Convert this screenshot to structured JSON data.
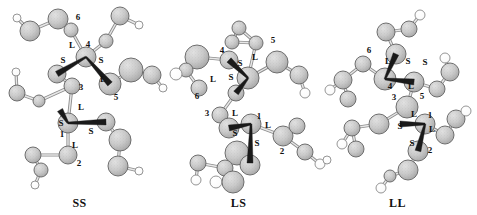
{
  "figure": {
    "background": "#ffffff",
    "panel_count": 3,
    "atom_color": "#c9c9c9",
    "atom_stroke": "#6e6e6e",
    "hydrogen_color": "#ffffff",
    "bond_color": "#9a9a9a",
    "wedge_color": "#1a1a1a",
    "label_color": "#111111"
  },
  "panels": [
    {
      "id": "ss",
      "caption": "SS",
      "center_labels": [
        {
          "text": "6",
          "x": 78,
          "y": 20
        },
        {
          "text": "L",
          "x": 72,
          "y": 48
        },
        {
          "text": "4",
          "x": 88,
          "y": 47
        },
        {
          "text": "S",
          "x": 63,
          "y": 63
        },
        {
          "text": "S",
          "x": 101,
          "y": 63
        },
        {
          "text": "L",
          "x": 103,
          "y": 82
        },
        {
          "text": "5",
          "x": 116,
          "y": 100
        },
        {
          "text": "3",
          "x": 81,
          "y": 90
        },
        {
          "text": "L",
          "x": 81,
          "y": 110
        },
        {
          "text": "S",
          "x": 61,
          "y": 126
        },
        {
          "text": "1",
          "x": 62,
          "y": 137
        },
        {
          "text": "S",
          "x": 91,
          "y": 134
        },
        {
          "text": "L",
          "x": 75,
          "y": 148
        },
        {
          "text": "2",
          "x": 79,
          "y": 166
        }
      ],
      "atoms": [
        {
          "x": 17,
          "y": 18,
          "r": 4,
          "t": "h"
        },
        {
          "x": 30,
          "y": 31,
          "r": 10,
          "t": "c"
        },
        {
          "x": 58,
          "y": 19,
          "r": 10,
          "t": "c"
        },
        {
          "x": 71,
          "y": 30,
          "r": 7,
          "t": "c"
        },
        {
          "x": 86,
          "y": 57,
          "r": 10,
          "t": "c"
        },
        {
          "x": 120,
          "y": 16,
          "r": 9,
          "t": "c"
        },
        {
          "x": 139,
          "y": 25,
          "r": 4,
          "t": "h"
        },
        {
          "x": 106,
          "y": 41,
          "r": 7,
          "t": "c"
        },
        {
          "x": 57,
          "y": 74,
          "r": 9,
          "t": "c"
        },
        {
          "x": 16,
          "y": 72,
          "r": 4,
          "t": "h"
        },
        {
          "x": 17,
          "y": 93,
          "r": 8,
          "t": "c"
        },
        {
          "x": 39,
          "y": 101,
          "r": 6,
          "t": "c"
        },
        {
          "x": 72,
          "y": 86,
          "r": 8,
          "t": "c"
        },
        {
          "x": 110,
          "y": 84,
          "r": 11,
          "t": "c"
        },
        {
          "x": 131,
          "y": 70,
          "r": 12,
          "t": "c"
        },
        {
          "x": 152,
          "y": 75,
          "r": 9,
          "t": "c"
        },
        {
          "x": 163,
          "y": 88,
          "r": 4,
          "t": "h"
        },
        {
          "x": 68,
          "y": 123,
          "r": 10,
          "t": "c"
        },
        {
          "x": 106,
          "y": 122,
          "r": 9,
          "t": "c"
        },
        {
          "x": 120,
          "y": 140,
          "r": 11,
          "t": "c"
        },
        {
          "x": 118,
          "y": 166,
          "r": 10,
          "t": "c"
        },
        {
          "x": 139,
          "y": 171,
          "r": 4,
          "t": "h"
        },
        {
          "x": 68,
          "y": 155,
          "r": 9,
          "t": "c"
        },
        {
          "x": 33,
          "y": 155,
          "r": 8,
          "t": "c"
        },
        {
          "x": 41,
          "y": 170,
          "r": 7,
          "t": "c"
        },
        {
          "x": 35,
          "y": 185,
          "r": 4,
          "t": "h"
        }
      ],
      "bonds": [
        {
          "a": 0,
          "b": 1
        },
        {
          "a": 1,
          "b": 2
        },
        {
          "a": 2,
          "b": 3
        },
        {
          "a": 3,
          "b": 4
        },
        {
          "a": 5,
          "b": 6
        },
        {
          "a": 5,
          "b": 7
        },
        {
          "a": 7,
          "b": 4
        },
        {
          "a": 4,
          "b": 13
        },
        {
          "a": 8,
          "b": 12
        },
        {
          "a": 9,
          "b": 10
        },
        {
          "a": 10,
          "b": 11
        },
        {
          "a": 11,
          "b": 12
        },
        {
          "a": 13,
          "b": 14
        },
        {
          "a": 14,
          "b": 15
        },
        {
          "a": 15,
          "b": 16
        },
        {
          "a": 12,
          "b": 17
        },
        {
          "a": 17,
          "b": 22
        },
        {
          "a": 18,
          "b": 19
        },
        {
          "a": 19,
          "b": 20
        },
        {
          "a": 20,
          "b": 21
        },
        {
          "a": 22,
          "b": 23
        },
        {
          "a": 23,
          "b": 24
        },
        {
          "a": 24,
          "b": 25
        }
      ],
      "wedges": [
        {
          "from": {
            "x": 86,
            "y": 57
          },
          "to": {
            "x": 57,
            "y": 74
          }
        },
        {
          "from": {
            "x": 86,
            "y": 57
          },
          "to": {
            "x": 110,
            "y": 84
          }
        },
        {
          "from": {
            "x": 68,
            "y": 123
          },
          "to": {
            "x": 60,
            "y": 110
          }
        },
        {
          "from": {
            "x": 68,
            "y": 123
          },
          "to": {
            "x": 106,
            "y": 122
          }
        }
      ]
    },
    {
      "id": "ls",
      "caption": "LS",
      "center_labels": [
        {
          "text": "5",
          "x": 273,
          "y": 43
        },
        {
          "text": "4",
          "x": 222,
          "y": 53
        },
        {
          "text": "L",
          "x": 255,
          "y": 60
        },
        {
          "text": "S",
          "x": 240,
          "y": 66
        },
        {
          "text": "S",
          "x": 231,
          "y": 80
        },
        {
          "text": "L",
          "x": 213,
          "y": 82
        },
        {
          "text": "6",
          "x": 197,
          "y": 99
        },
        {
          "text": "3",
          "x": 207,
          "y": 116
        },
        {
          "text": "L",
          "x": 235,
          "y": 116
        },
        {
          "text": "1",
          "x": 259,
          "y": 119
        },
        {
          "text": "L",
          "x": 268,
          "y": 128
        },
        {
          "text": "S",
          "x": 235,
          "y": 136
        },
        {
          "text": "S",
          "x": 257,
          "y": 146
        },
        {
          "text": "2",
          "x": 282,
          "y": 154
        }
      ],
      "atoms": [
        {
          "x": 239,
          "y": 28,
          "r": 7,
          "t": "c"
        },
        {
          "x": 232,
          "y": 42,
          "r": 7,
          "t": "c"
        },
        {
          "x": 256,
          "y": 43,
          "r": 7,
          "t": "c"
        },
        {
          "x": 229,
          "y": 60,
          "r": 9,
          "t": "c"
        },
        {
          "x": 197,
          "y": 57,
          "r": 12,
          "t": "c"
        },
        {
          "x": 186,
          "y": 70,
          "r": 7,
          "t": "c"
        },
        {
          "x": 176,
          "y": 74,
          "r": 6,
          "t": "h"
        },
        {
          "x": 199,
          "y": 88,
          "r": 8,
          "t": "c"
        },
        {
          "x": 248,
          "y": 78,
          "r": 11,
          "t": "c"
        },
        {
          "x": 277,
          "y": 62,
          "r": 11,
          "t": "c"
        },
        {
          "x": 299,
          "y": 75,
          "r": 9,
          "t": "c"
        },
        {
          "x": 305,
          "y": 93,
          "r": 5,
          "t": "h"
        },
        {
          "x": 236,
          "y": 93,
          "r": 8,
          "t": "c"
        },
        {
          "x": 220,
          "y": 115,
          "r": 8,
          "t": "c"
        },
        {
          "x": 229,
          "y": 128,
          "r": 10,
          "t": "c"
        },
        {
          "x": 251,
          "y": 124,
          "r": 10,
          "t": "c"
        },
        {
          "x": 283,
          "y": 136,
          "r": 10,
          "t": "c"
        },
        {
          "x": 297,
          "y": 126,
          "r": 8,
          "t": "c"
        },
        {
          "x": 305,
          "y": 152,
          "r": 8,
          "t": "c"
        },
        {
          "x": 320,
          "y": 164,
          "r": 5,
          "t": "h"
        },
        {
          "x": 237,
          "y": 153,
          "r": 12,
          "t": "c"
        },
        {
          "x": 250,
          "y": 165,
          "r": 10,
          "t": "c"
        },
        {
          "x": 225,
          "y": 168,
          "r": 8,
          "t": "c"
        },
        {
          "x": 198,
          "y": 163,
          "r": 8,
          "t": "c"
        },
        {
          "x": 196,
          "y": 180,
          "r": 5,
          "t": "h"
        },
        {
          "x": 216,
          "y": 182,
          "r": 6,
          "t": "h"
        },
        {
          "x": 233,
          "y": 182,
          "r": 11,
          "t": "c"
        }
      ],
      "bonds": [
        {
          "a": 0,
          "b": 1
        },
        {
          "a": 1,
          "b": 2
        },
        {
          "a": 0,
          "b": 2
        },
        {
          "a": 2,
          "b": 8
        },
        {
          "a": 3,
          "b": 4
        },
        {
          "a": 4,
          "b": 5
        },
        {
          "a": 5,
          "b": 6
        },
        {
          "a": 5,
          "b": 7
        },
        {
          "a": 3,
          "b": 8
        },
        {
          "a": 8,
          "b": 9
        },
        {
          "a": 9,
          "b": 10
        },
        {
          "a": 10,
          "b": 11
        },
        {
          "a": 12,
          "b": 13
        },
        {
          "a": 13,
          "b": 14
        },
        {
          "a": 15,
          "b": 16
        },
        {
          "a": 16,
          "b": 17
        },
        {
          "a": 16,
          "b": 18
        },
        {
          "a": 18,
          "b": 19
        },
        {
          "a": 20,
          "b": 21
        },
        {
          "a": 20,
          "b": 22
        },
        {
          "a": 22,
          "b": 23
        },
        {
          "a": 23,
          "b": 24
        },
        {
          "a": 22,
          "b": 26
        },
        {
          "a": 25,
          "b": 26
        }
      ],
      "wedges": [
        {
          "from": {
            "x": 248,
            "y": 78
          },
          "to": {
            "x": 229,
            "y": 60
          }
        },
        {
          "from": {
            "x": 248,
            "y": 78
          },
          "to": {
            "x": 236,
            "y": 93
          }
        },
        {
          "from": {
            "x": 251,
            "y": 124
          },
          "to": {
            "x": 229,
            "y": 128
          }
        },
        {
          "from": {
            "x": 251,
            "y": 124
          },
          "to": {
            "x": 250,
            "y": 163
          }
        }
      ]
    },
    {
      "id": "ll",
      "caption": "LL",
      "center_labels": [
        {
          "text": "6",
          "x": 369,
          "y": 53
        },
        {
          "text": "L",
          "x": 388,
          "y": 64
        },
        {
          "text": "S",
          "x": 408,
          "y": 64
        },
        {
          "text": "S",
          "x": 425,
          "y": 65
        },
        {
          "text": "4",
          "x": 390,
          "y": 89
        },
        {
          "text": "L",
          "x": 411,
          "y": 89
        },
        {
          "text": "3",
          "x": 394,
          "y": 100
        },
        {
          "text": "5",
          "x": 422,
          "y": 99
        },
        {
          "text": "L",
          "x": 414,
          "y": 117
        },
        {
          "text": "1",
          "x": 430,
          "y": 118
        },
        {
          "text": "S",
          "x": 400,
          "y": 129
        },
        {
          "text": "L",
          "x": 432,
          "y": 132
        },
        {
          "text": "S",
          "x": 412,
          "y": 146
        },
        {
          "text": "2",
          "x": 430,
          "y": 153
        }
      ],
      "atoms": [
        {
          "x": 420,
          "y": 15,
          "r": 5,
          "t": "h"
        },
        {
          "x": 409,
          "y": 29,
          "r": 8,
          "t": "c"
        },
        {
          "x": 386,
          "y": 32,
          "r": 9,
          "t": "c"
        },
        {
          "x": 396,
          "y": 54,
          "r": 10,
          "t": "c"
        },
        {
          "x": 385,
          "y": 79,
          "r": 11,
          "t": "c"
        },
        {
          "x": 363,
          "y": 64,
          "r": 8,
          "t": "c"
        },
        {
          "x": 343,
          "y": 80,
          "r": 9,
          "t": "c"
        },
        {
          "x": 330,
          "y": 90,
          "r": 5,
          "t": "h"
        },
        {
          "x": 348,
          "y": 99,
          "r": 8,
          "t": "c"
        },
        {
          "x": 414,
          "y": 82,
          "r": 10,
          "t": "c"
        },
        {
          "x": 437,
          "y": 89,
          "r": 8,
          "t": "c"
        },
        {
          "x": 450,
          "y": 72,
          "r": 9,
          "t": "c"
        },
        {
          "x": 445,
          "y": 58,
          "r": 5,
          "t": "h"
        },
        {
          "x": 407,
          "y": 107,
          "r": 11,
          "t": "c"
        },
        {
          "x": 379,
          "y": 124,
          "r": 10,
          "t": "c"
        },
        {
          "x": 352,
          "y": 128,
          "r": 8,
          "t": "c"
        },
        {
          "x": 342,
          "y": 144,
          "r": 5,
          "t": "h"
        },
        {
          "x": 356,
          "y": 149,
          "r": 8,
          "t": "c"
        },
        {
          "x": 425,
          "y": 124,
          "r": 10,
          "t": "c"
        },
        {
          "x": 445,
          "y": 135,
          "r": 9,
          "t": "c"
        },
        {
          "x": 456,
          "y": 119,
          "r": 9,
          "t": "c"
        },
        {
          "x": 466,
          "y": 111,
          "r": 5,
          "t": "h"
        },
        {
          "x": 418,
          "y": 151,
          "r": 10,
          "t": "c"
        },
        {
          "x": 408,
          "y": 170,
          "r": 10,
          "t": "c"
        },
        {
          "x": 390,
          "y": 176,
          "r": 6,
          "t": "c"
        },
        {
          "x": 381,
          "y": 188,
          "r": 5,
          "t": "h"
        },
        {
          "x": 327,
          "y": 160,
          "r": 4,
          "t": "h"
        }
      ],
      "bonds": [
        {
          "a": 0,
          "b": 1
        },
        {
          "a": 1,
          "b": 2
        },
        {
          "a": 2,
          "b": 3
        },
        {
          "a": 4,
          "b": 5
        },
        {
          "a": 5,
          "b": 6
        },
        {
          "a": 6,
          "b": 7
        },
        {
          "a": 6,
          "b": 8
        },
        {
          "a": 9,
          "b": 10
        },
        {
          "a": 10,
          "b": 11
        },
        {
          "a": 11,
          "b": 12
        },
        {
          "a": 9,
          "b": 13
        },
        {
          "a": 13,
          "b": 14
        },
        {
          "a": 14,
          "b": 15
        },
        {
          "a": 15,
          "b": 16
        },
        {
          "a": 15,
          "b": 17
        },
        {
          "a": 18,
          "b": 19
        },
        {
          "a": 19,
          "b": 20
        },
        {
          "a": 20,
          "b": 21
        },
        {
          "a": 22,
          "b": 23
        },
        {
          "a": 23,
          "b": 24
        },
        {
          "a": 24,
          "b": 25
        }
      ],
      "wedges": [
        {
          "from": {
            "x": 385,
            "y": 79
          },
          "to": {
            "x": 396,
            "y": 54
          }
        },
        {
          "from": {
            "x": 385,
            "y": 79
          },
          "to": {
            "x": 414,
            "y": 82
          }
        },
        {
          "from": {
            "x": 425,
            "y": 124
          },
          "to": {
            "x": 400,
            "y": 124
          }
        },
        {
          "from": {
            "x": 425,
            "y": 124
          },
          "to": {
            "x": 418,
            "y": 151
          }
        }
      ]
    }
  ]
}
